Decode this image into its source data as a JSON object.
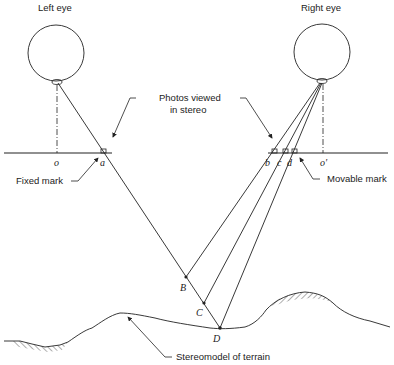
{
  "diagram": {
    "type": "stereoscopic parallax measurement schematic",
    "labels": {
      "left_eye": "Left eye",
      "right_eye": "Right eye",
      "photos_line1": "Photos viewed",
      "photos_line2": "in stereo",
      "fixed_mark": "Fixed mark",
      "movable_mark": "Movable mark",
      "terrain": "Stereomodel of terrain"
    },
    "points": {
      "o": "o",
      "a": "a",
      "b": "b",
      "c": "c",
      "d": "d",
      "o_prime": "o′",
      "B": "B",
      "C": "C",
      "D": "D"
    },
    "colors": {
      "line": "#222222",
      "background": "#ffffff"
    }
  }
}
